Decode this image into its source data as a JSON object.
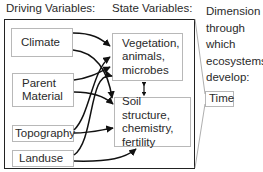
{
  "headers": {
    "driving": "Driving Variables:",
    "state": "State Variables:"
  },
  "driving_variables": [
    {
      "id": "climate",
      "label": "Climate"
    },
    {
      "id": "parent_material",
      "line1": "Parent",
      "line2": "Material"
    },
    {
      "id": "topography",
      "label": "Topography"
    },
    {
      "id": "landuse",
      "label": "Landuse"
    }
  ],
  "state_variables": [
    {
      "id": "vegetation",
      "line1": "Vegetation,",
      "line2": "animals,",
      "line3": "microbes"
    },
    {
      "id": "soil",
      "line1": "Soil structure,",
      "line2": "chemistry,",
      "line3": "fertility"
    }
  ],
  "dimension": {
    "line1": "Dimension",
    "line2": "through",
    "line3": "which",
    "line4": "ecosystems",
    "line5": "develop:",
    "time_label": "Time"
  },
  "colors": {
    "arrow": "#111111",
    "box_border": "#b8b8b8",
    "outer_border": "#222222"
  }
}
